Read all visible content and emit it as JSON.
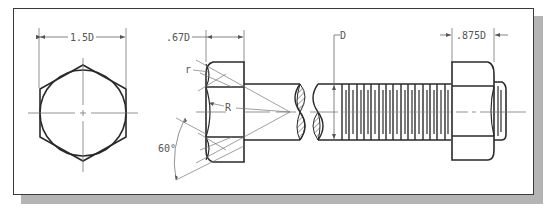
{
  "figure": {
    "colors": {
      "outline": "#2a2a2a",
      "thin": "#6a6a6a",
      "shadow": "#b4b4b4",
      "frame": "#3a3a3a",
      "hatch": "#555555"
    }
  },
  "top_view": {
    "dimension_label": "1.5D"
  },
  "bolt_head": {
    "height_label": ".67D",
    "small_radius_label": "r",
    "radius_label": "R",
    "chamfer_angle_label": "60°"
  },
  "shank": {
    "diameter_label": "D"
  },
  "nut": {
    "height_label": ".875D"
  }
}
